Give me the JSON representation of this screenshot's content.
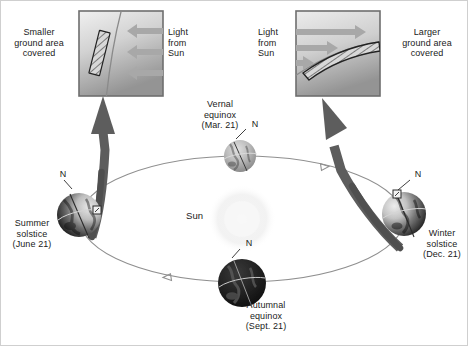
{
  "figure": {
    "background_color": "#ffffff",
    "border_color": "#c8c8c8",
    "text_color": "#1a1a1a"
  },
  "insets": {
    "left": {
      "caption": "Smaller\nground area\ncovered",
      "light_label": "Light\nfrom\nSun",
      "panel_border_color": "#6e6e6e",
      "panel_fill_top": "#efefef",
      "panel_fill_bottom": "#9a9a9a",
      "arrow_color": "#a9a9a9",
      "arrow_count": 3,
      "arrow_direction": "left",
      "beam_patch": "narrow-hatched-strip"
    },
    "right": {
      "caption": "Larger\nground area\ncovered",
      "light_label": "Light\nfrom\nSun",
      "panel_border_color": "#6e6e6e",
      "panel_fill_top": "#efefef",
      "panel_fill_bottom": "#9a9a9a",
      "arrow_color": "#a9a9a9",
      "arrow_count": 3,
      "arrow_direction": "right",
      "beam_patch": "wide-hatched-band"
    }
  },
  "sun": {
    "label": "Sun",
    "glow_color": "#f2f2f2"
  },
  "orbit": {
    "stroke_color": "#8c8c8c",
    "direction_arrow_count": 2,
    "shape": "ellipse"
  },
  "pointer_arrows": {
    "color": "#5a5a5a",
    "count": 2,
    "description": "thick curved arrows from solstice Earths up to inset panels"
  },
  "earths": [
    {
      "id": "summer-solstice",
      "name": "Summer solstice",
      "label": "Summer\nsolstice\n(June 21)",
      "pole_label": "N",
      "lit_side": "right",
      "dark_side": "left",
      "has_sun_angle_marker": true
    },
    {
      "id": "vernal-equinox",
      "name": "Vernal equinox",
      "label": "Vernal\nequinox\n(Mar. 21)",
      "pole_label": "N",
      "lit_side": "full",
      "dark_side": "none",
      "has_sun_angle_marker": false
    },
    {
      "id": "winter-solstice",
      "name": "Winter solstice",
      "label": "Winter\nsolstice\n(Dec. 21)",
      "pole_label": "N",
      "lit_side": "left",
      "dark_side": "right",
      "has_sun_angle_marker": true
    },
    {
      "id": "autumnal-equinox",
      "name": "Autumnal equinox",
      "label": "Autumnal\nequinox\n(Sept. 21)",
      "pole_label": "N",
      "lit_side": "none",
      "dark_side": "full",
      "has_sun_angle_marker": false
    }
  ]
}
